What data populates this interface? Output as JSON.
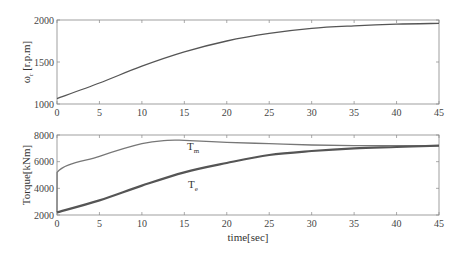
{
  "chart_data": [
    {
      "type": "line",
      "title": "",
      "xlabel": "",
      "ylabel": "ω_r [r.p.m]",
      "xlim": [
        0,
        45
      ],
      "ylim": [
        1000,
        2000
      ],
      "xticks": [
        "0",
        "5",
        "10",
        "15",
        "20",
        "25",
        "30",
        "35",
        "40",
        "45"
      ],
      "yticks": [
        "1000",
        "1500",
        "2000"
      ],
      "grid": false,
      "series": [
        {
          "name": "ω_r",
          "x": [
            0,
            5,
            10,
            15,
            20,
            25,
            30,
            35,
            40,
            45
          ],
          "values": [
            1065,
            1250,
            1450,
            1620,
            1750,
            1840,
            1900,
            1930,
            1950,
            1960
          ]
        }
      ]
    },
    {
      "type": "line",
      "title": "",
      "xlabel": "time[sec]",
      "ylabel": "Torque[kNm]",
      "xlim": [
        0,
        45
      ],
      "ylim": [
        2000,
        8000
      ],
      "xticks": [
        "0",
        "5",
        "10",
        "15",
        "20",
        "25",
        "30",
        "35",
        "40",
        "45"
      ],
      "yticks": [
        "2000",
        "4000",
        "6000",
        "8000"
      ],
      "grid": false,
      "annotations": [
        {
          "text": "T_m",
          "x": 15,
          "y": 7300
        },
        {
          "text": "T_e",
          "x": 15,
          "y": 3700
        }
      ],
      "series": [
        {
          "name": "T_m",
          "x": [
            0,
            0.01,
            5,
            10,
            13,
            15,
            20,
            25,
            30,
            35,
            40,
            45
          ],
          "values": [
            2200,
            5200,
            6400,
            7350,
            7600,
            7600,
            7450,
            7350,
            7250,
            7200,
            7200,
            7200
          ]
        },
        {
          "name": "T_e",
          "x": [
            0,
            5,
            10,
            15,
            20,
            25,
            30,
            35,
            40,
            45
          ],
          "values": [
            2200,
            3100,
            4200,
            5200,
            5900,
            6500,
            6800,
            7000,
            7100,
            7200
          ]
        }
      ]
    }
  ],
  "labels": {
    "top_ylabel": "ω",
    "top_ylabel_sub": "r",
    "top_ylabel_rest": " [r.p.m]",
    "bottom_ylabel": "Torque[kNm]",
    "xlabel": "time[sec]",
    "tm_main": "T",
    "tm_sub": "m",
    "te_main": "T",
    "te_sub": "e"
  }
}
